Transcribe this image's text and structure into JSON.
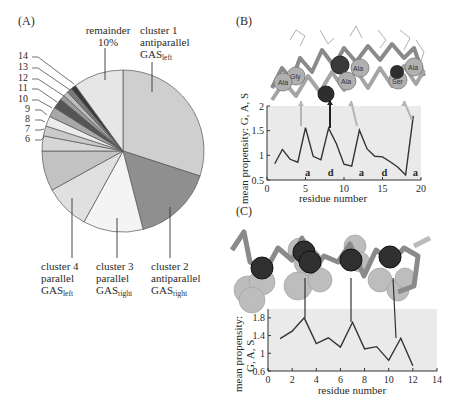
{
  "panels": {
    "A": "(A)",
    "B": "(B)",
    "C": "(C)"
  },
  "pie_labels": {
    "remainder_line1": "remainder",
    "remainder_line2": "10%",
    "c1_line1": "cluster 1",
    "c1_line2": "antiparallel",
    "c1_line3": "GAS",
    "c1_sub": "left",
    "c2_line1": "cluster 2",
    "c2_line2": "antiparallel",
    "c2_line3": "GAS",
    "c2_sub": "right",
    "c3_line1": "cluster 3",
    "c3_line2": "parallel",
    "c3_line3": "GAS",
    "c3_sub": "right",
    "c4_line1": "cluster 4",
    "c4_line2": "parallel",
    "c4_line3": "GAS",
    "c4_sub": "left",
    "small": [
      "14",
      "13",
      "12",
      "11",
      "10",
      "9",
      "8",
      "7",
      "6"
    ]
  },
  "chartB_labels": {
    "ylabel": "mean propensity: G, A, S",
    "xlabel": "residue number",
    "yticks": [
      "2",
      "1.5",
      "1",
      "0.5"
    ],
    "xticks": [
      "0",
      "5",
      "10",
      "15",
      "20"
    ],
    "annotations": [
      "a",
      "d",
      "a",
      "d",
      "a"
    ],
    "residues": [
      "Gly",
      "Ala",
      "Ala",
      "Ala",
      "Ala",
      "Ser",
      "Ala"
    ]
  },
  "chartC_labels": {
    "ylabel_line1": "mean propensity:",
    "ylabel_line2": "G, A, S",
    "xlabel": "residue number",
    "yticks": [
      "1.8",
      "1.4",
      "1",
      "0.6"
    ],
    "xticks": [
      "0",
      "2",
      "4",
      "6",
      "8",
      "10",
      "12",
      "14"
    ]
  },
  "chart_data": [
    {
      "type": "pie",
      "title": "(A)",
      "categories": [
        "cluster 1 antiparallel GAS_left",
        "cluster 2 antiparallel GAS_right",
        "cluster 3 parallel GAS_right",
        "cluster 4 parallel GAS_left",
        "5",
        "6",
        "7",
        "8",
        "9",
        "10",
        "11",
        "12",
        "13",
        "14",
        "remainder"
      ],
      "values": [
        30,
        16,
        12,
        9,
        8,
        3,
        2,
        2,
        2,
        2,
        1,
        1,
        1,
        1,
        10
      ],
      "colors": [
        "#cfcfcf",
        "#8f8f8f",
        "#f4f4f4",
        "#e0e0e0",
        "#c2c2c2",
        "#d6d6d6",
        "#cacaca",
        "#ececec",
        "#a8a8a8",
        "#555555",
        "#9a9a9a",
        "#bdbdbd",
        "#7a7a7a",
        "#3a3a3a",
        "#e6e6e6"
      ],
      "annotations": [
        "remainder 10%"
      ]
    },
    {
      "type": "line",
      "title": "(B)",
      "xlabel": "residue number",
      "ylabel": "mean propensity: G, A, S",
      "x": [
        1,
        2,
        3,
        4,
        5,
        6,
        7,
        8,
        9,
        10,
        11,
        12,
        13,
        14,
        15,
        16,
        17,
        18,
        19
      ],
      "series": [
        {
          "name": "mean propensity",
          "values": [
            0.83,
            1.12,
            0.92,
            0.86,
            1.56,
            0.98,
            0.91,
            1.55,
            1.24,
            0.82,
            0.78,
            1.51,
            1.13,
            0.98,
            0.97,
            0.87,
            0.76,
            0.6,
            1.8
          ]
        }
      ],
      "xlim": [
        0,
        20
      ],
      "ylim": [
        0.5,
        2
      ],
      "xticks": [
        0,
        5,
        10,
        15,
        20
      ],
      "yticks": [
        0.5,
        1,
        1.5,
        2
      ],
      "heptad_annotations": [
        {
          "x": 5,
          "label": "a"
        },
        {
          "x": 8,
          "label": "d"
        },
        {
          "x": 12,
          "label": "a"
        },
        {
          "x": 15,
          "label": "d"
        },
        {
          "x": 19,
          "label": "a"
        }
      ],
      "grid": false
    },
    {
      "type": "line",
      "title": "(C)",
      "xlabel": "residue number",
      "ylabel": "mean propensity: G, A, S",
      "x": [
        1,
        2,
        3,
        4,
        5,
        6,
        7,
        8,
        9,
        10,
        11,
        12
      ],
      "series": [
        {
          "name": "mean propensity",
          "values": [
            1.33,
            1.5,
            1.8,
            1.22,
            1.35,
            1.14,
            1.7,
            1.1,
            1.15,
            0.84,
            1.34,
            0.72
          ]
        }
      ],
      "xlim": [
        0,
        14
      ],
      "ylim": [
        0.6,
        2.0
      ],
      "xticks": [
        0,
        2,
        4,
        6,
        8,
        10,
        12,
        14
      ],
      "yticks": [
        0.6,
        1,
        1.4,
        1.8
      ],
      "grid": false
    }
  ]
}
